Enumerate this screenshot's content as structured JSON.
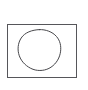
{
  "canvas": {
    "background_color": "#ffffff"
  },
  "drawing": {
    "rectangle": {
      "x": 7,
      "y": 24,
      "width": 70,
      "height": 53,
      "stroke_color": "#56565a",
      "fill": "none"
    },
    "circle": {
      "cx": 39,
      "cy": 50,
      "radius": 21,
      "stroke_color": "#47474b",
      "fill": "none"
    }
  }
}
